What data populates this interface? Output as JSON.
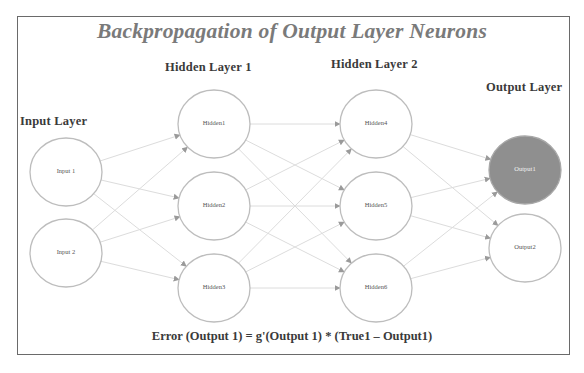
{
  "title": "Backpropagation of Output Layer Neurons",
  "layers": [
    {
      "label": "Input Layer",
      "label_pos": {
        "x": 20,
        "y": 114
      },
      "nodes": [
        {
          "id": "Input 1",
          "label": "Input 1",
          "cx": 66,
          "cy": 172
        },
        {
          "id": "Input 2",
          "label": "Input 2",
          "cx": 66,
          "cy": 253
        }
      ]
    },
    {
      "label": "Hidden Layer 1",
      "label_pos": {
        "x": 165,
        "y": 60
      },
      "nodes": [
        {
          "id": "Hidden1",
          "label": "Hidden1",
          "cx": 214,
          "cy": 124
        },
        {
          "id": "Hidden2",
          "label": "Hidden2",
          "cx": 214,
          "cy": 206
        },
        {
          "id": "Hidden3",
          "label": "Hidden3",
          "cx": 214,
          "cy": 288
        }
      ]
    },
    {
      "label": "Hidden Layer 2",
      "label_pos": {
        "x": 331,
        "y": 57
      },
      "nodes": [
        {
          "id": "Hidden4",
          "label": "Hidden4",
          "cx": 376,
          "cy": 124
        },
        {
          "id": "Hidden5",
          "label": "Hidden5",
          "cx": 376,
          "cy": 206
        },
        {
          "id": "Hidden6",
          "label": "Hidden6",
          "cx": 376,
          "cy": 288
        }
      ]
    },
    {
      "label": "Output Layer",
      "label_pos": {
        "x": 486,
        "y": 80
      },
      "nodes": [
        {
          "id": "Output1",
          "label": "Output1",
          "cx": 525,
          "cy": 170,
          "highlighted": true
        },
        {
          "id": "Output2",
          "label": "Output2",
          "cx": 525,
          "cy": 248
        }
      ]
    }
  ],
  "node_radius": {
    "rx": 36,
    "ry": 34
  },
  "connections": "fully-connected between adjacent layers",
  "formula": "Error (Output 1) = g'(Output 1) * (True1 – Output1)",
  "colors": {
    "title": "#7a7a7a",
    "frame": "#6a6a6a",
    "node_stroke": "#bdbdbd",
    "highlight_fill": "#8f8f8f",
    "edge": "#dcdcdc",
    "arrowhead": "#9a9a9a",
    "label_text": "#3a3a3a"
  }
}
